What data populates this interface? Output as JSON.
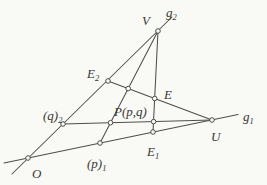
{
  "figure": {
    "width": 267,
    "height": 185,
    "background": "#f9f9f6",
    "line_color": "#4e4e4a",
    "text_color": "#383834",
    "marker_fill": "#f9f9f6",
    "marker_radius": 2.3,
    "line_width": 1.05,
    "font_size": 13,
    "sub_font_size": 8.5,
    "segments": [
      {
        "name": "g2-line",
        "x1": 12,
        "y1": 174,
        "x2": 172,
        "y2": 17
      },
      {
        "name": "g1-line",
        "x1": 4,
        "y1": 163,
        "x2": 238,
        "y2": 114.5
      },
      {
        "name": "q2-U-line",
        "x1": 63,
        "y1": 124,
        "x2": 212,
        "y2": 120
      },
      {
        "name": "V-p1-line",
        "x1": 158,
        "y1": 31,
        "x2": 100,
        "y2": 143
      },
      {
        "name": "E2-U-line",
        "x1": 108,
        "y1": 81,
        "x2": 212,
        "y2": 120
      },
      {
        "name": "V-E1-line",
        "x1": 158,
        "y1": 31,
        "x2": 153,
        "y2": 132
      }
    ],
    "points": [
      {
        "name": "O",
        "x": 28,
        "y": 158
      },
      {
        "name": "V",
        "x": 158,
        "y": 31
      },
      {
        "name": "U",
        "x": 212,
        "y": 120
      },
      {
        "name": "E2",
        "x": 108,
        "y": 81
      },
      {
        "name": "q2",
        "x": 63,
        "y": 124
      },
      {
        "name": "p1",
        "x": 100,
        "y": 143
      },
      {
        "name": "E1",
        "x": 153,
        "y": 132
      },
      {
        "name": "E",
        "x": 154.7,
        "y": 98.5
      },
      {
        "name": "P",
        "x": 110.5,
        "y": 122.7
      },
      {
        "name": "aux-Vp1-E2U",
        "x": 128.2,
        "y": 88.6
      },
      {
        "name": "aux-VE1-q2U",
        "x": 153.6,
        "y": 121.6
      }
    ],
    "labels": [
      {
        "name": "V",
        "base": "V",
        "sub": "",
        "x": 142,
        "y": 25
      },
      {
        "name": "g2",
        "base": "g",
        "sub": "2",
        "x": 166,
        "y": 17
      },
      {
        "name": "E2",
        "base": "E",
        "sub": "2",
        "x": 87,
        "y": 78
      },
      {
        "name": "E",
        "base": "E",
        "sub": "",
        "x": 164,
        "y": 99
      },
      {
        "name": "q2",
        "base": "(q)",
        "sub": "2",
        "x": 43,
        "y": 120
      },
      {
        "name": "P",
        "base": "P(p,q)",
        "sub": "",
        "x": 114,
        "y": 116
      },
      {
        "name": "g1",
        "base": "g",
        "sub": "1",
        "x": 243,
        "y": 121
      },
      {
        "name": "U",
        "base": "U",
        "sub": "",
        "x": 211,
        "y": 141
      },
      {
        "name": "E1",
        "base": "E",
        "sub": "1",
        "x": 147,
        "y": 156
      },
      {
        "name": "p1",
        "base": "(p)",
        "sub": "1",
        "x": 87,
        "y": 168
      },
      {
        "name": "O",
        "base": "O",
        "sub": "",
        "x": 32,
        "y": 178
      }
    ]
  }
}
